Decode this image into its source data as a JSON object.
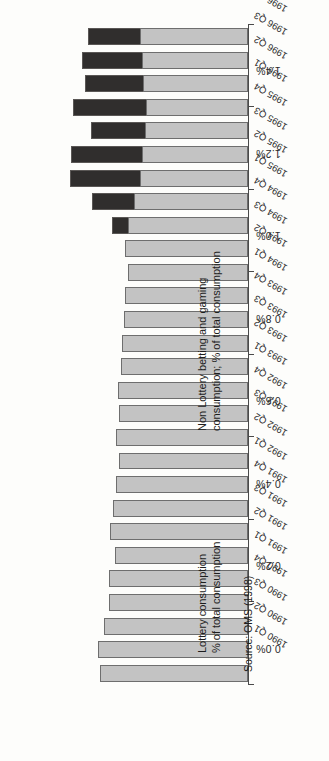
{
  "figure": {
    "source_note": "Source: OMS (1998)",
    "orientation": "page-rotated-90",
    "series_labels": {
      "lottery": "Lottery consumption\n% of total consumption",
      "lottery_line1": "Lottery consumption",
      "lottery_line2": "% of total consumption",
      "nonlottery_line1": "Non Lottery betting and gaming",
      "nonlottery_line2": "consumption; % of total consumption"
    },
    "colors": {
      "lottery": "#302e2d",
      "non_lottery": "#c3c3c3",
      "axis": "#4a4a4a",
      "text": "#1d1d1d",
      "background": "#fdfdfb"
    }
  },
  "chart_data": {
    "type": "bar",
    "subtype": "stacked-horizontal",
    "title": "",
    "subtitle": "",
    "xlabel": "",
    "ylabel": "% of total consumption",
    "ylim": [
      0.0,
      1.6
    ],
    "grid": false,
    "legend_position": "inline-annotations",
    "tick_labels": [
      "1.6%",
      "1.4%",
      "1.2%",
      "1.0%",
      "0.8%",
      "0.6%",
      "0.4%",
      "0.2%",
      "0.0%"
    ],
    "tick_values": [
      1.6,
      1.4,
      1.2,
      1.0,
      0.8,
      0.6,
      0.4,
      0.2,
      0.0
    ],
    "categories": [
      "1990 Q1",
      "1990 Q2",
      "1990 Q3",
      "1990 Q4",
      "1991 Q1",
      "1991 Q2",
      "1991 Q3",
      "1991 Q4",
      "1992 Q1",
      "1992 Q2",
      "1992 Q3",
      "1992 Q4",
      "1993 Q1",
      "1993 Q2",
      "1993 Q3",
      "1993 Q4",
      "1994 Q1",
      "1994 Q2",
      "1994 Q3",
      "1994 Q4",
      "1995 Q1",
      "1995 Q2",
      "1995 Q3",
      "1995 Q4",
      "1996 Q1",
      "1996 Q2",
      "1996 Q3",
      "1996 Q4"
    ],
    "series": [
      {
        "name": "Non Lottery betting and gaming consumption; % of total consumption",
        "color": "#c3c3c3",
        "values": [
          0.99,
          1.0,
          0.96,
          0.93,
          0.93,
          0.89,
          0.92,
          0.9,
          0.88,
          0.86,
          0.88,
          0.86,
          0.87,
          0.85,
          0.84,
          0.83,
          0.82,
          0.8,
          0.82,
          0.8,
          0.76,
          0.72,
          0.71,
          0.69,
          0.68,
          0.7,
          0.71,
          0.72
        ]
      },
      {
        "name": "Lottery consumption % of total consumption",
        "color": "#302e2d",
        "values": [
          0.0,
          0.0,
          0.0,
          0.0,
          0.0,
          0.0,
          0.0,
          0.0,
          0.0,
          0.0,
          0.0,
          0.0,
          0.0,
          0.0,
          0.0,
          0.0,
          0.0,
          0.0,
          0.0,
          0.11,
          0.28,
          0.47,
          0.47,
          0.36,
          0.49,
          0.39,
          0.4,
          0.35
        ]
      }
    ],
    "totals": [
      0.99,
      1.0,
      0.96,
      0.93,
      0.93,
      0.89,
      0.92,
      0.9,
      0.88,
      0.86,
      0.88,
      0.86,
      0.87,
      0.85,
      0.84,
      0.83,
      0.82,
      0.8,
      0.82,
      0.91,
      1.04,
      1.19,
      1.18,
      1.05,
      1.17,
      1.09,
      1.11,
      1.07
    ]
  }
}
